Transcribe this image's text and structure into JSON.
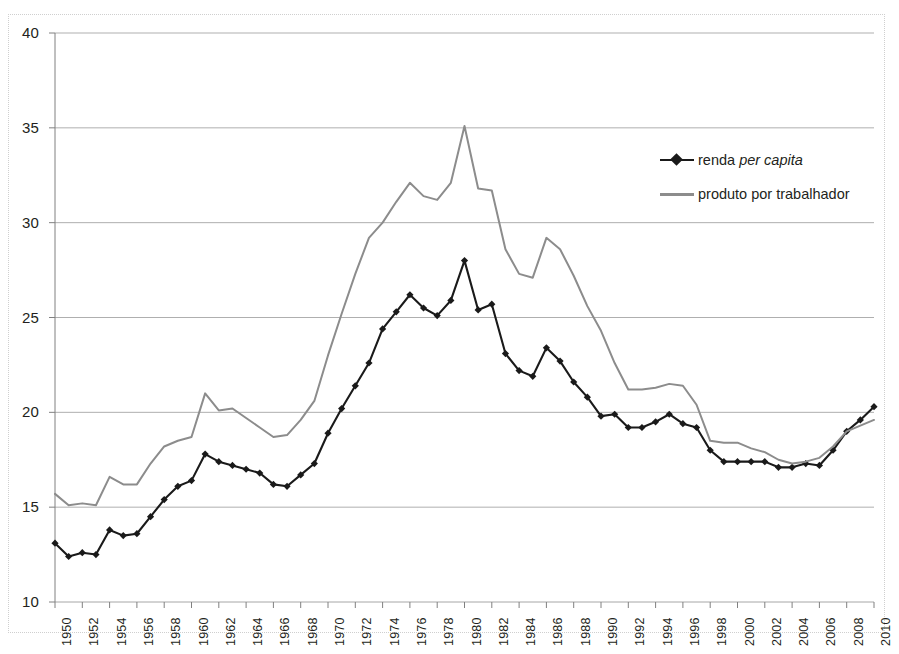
{
  "chart_data": {
    "type": "line",
    "title": "",
    "xlabel": "",
    "ylabel": "",
    "xlim": [
      1950,
      2010
    ],
    "ylim": [
      10,
      40
    ],
    "yticks": [
      10,
      15,
      20,
      25,
      30,
      35,
      40
    ],
    "xticks": [
      1950,
      1952,
      1954,
      1956,
      1958,
      1960,
      1962,
      1964,
      1966,
      1968,
      1970,
      1972,
      1974,
      1976,
      1978,
      1980,
      1982,
      1984,
      1986,
      1988,
      1990,
      1992,
      1994,
      1996,
      1998,
      2000,
      2002,
      2004,
      2006,
      2008,
      2010
    ],
    "grid": "horizontal",
    "legend_position": "upper-right",
    "x": [
      1950,
      1951,
      1952,
      1953,
      1954,
      1955,
      1956,
      1957,
      1958,
      1959,
      1960,
      1961,
      1962,
      1963,
      1964,
      1965,
      1966,
      1967,
      1968,
      1969,
      1970,
      1971,
      1972,
      1973,
      1974,
      1975,
      1976,
      1977,
      1978,
      1979,
      1980,
      1981,
      1982,
      1983,
      1984,
      1985,
      1986,
      1987,
      1988,
      1989,
      1990,
      1991,
      1992,
      1993,
      1994,
      1995,
      1996,
      1997,
      1998,
      1999,
      2000,
      2001,
      2002,
      2003,
      2004,
      2005,
      2006,
      2007,
      2008,
      2009,
      2010
    ],
    "series": [
      {
        "name": "renda per capita",
        "color": "#1a1a1a",
        "marker": "diamond",
        "values": [
          13.1,
          12.4,
          12.6,
          12.5,
          13.8,
          13.5,
          13.6,
          14.5,
          15.4,
          16.1,
          16.4,
          17.8,
          17.4,
          17.2,
          17.0,
          16.8,
          16.2,
          16.1,
          16.7,
          17.3,
          18.9,
          20.2,
          21.4,
          22.6,
          24.4,
          25.3,
          26.2,
          25.5,
          25.1,
          25.9,
          28.0,
          25.4,
          25.7,
          23.1,
          22.2,
          21.9,
          23.4,
          22.7,
          21.6,
          20.8,
          19.8,
          19.9,
          19.2,
          19.2,
          19.5,
          19.9,
          19.4,
          19.2,
          18.0,
          17.4,
          17.4,
          17.4,
          17.4,
          17.1,
          17.1,
          17.3,
          17.2,
          18.0,
          19.0,
          19.6,
          20.3
        ]
      },
      {
        "name": "produto por trabalhador",
        "color": "#8c8c8c",
        "marker": "none",
        "values": [
          15.7,
          15.1,
          15.2,
          15.1,
          16.6,
          16.2,
          16.2,
          17.3,
          18.2,
          18.5,
          18.7,
          21.0,
          20.1,
          20.2,
          19.7,
          19.2,
          18.7,
          18.8,
          19.6,
          20.6,
          23.0,
          25.2,
          27.3,
          29.2,
          30.0,
          31.1,
          32.1,
          31.4,
          31.2,
          32.1,
          35.1,
          31.8,
          31.7,
          28.6,
          27.3,
          27.1,
          29.2,
          28.6,
          27.2,
          25.6,
          24.3,
          22.6,
          21.2,
          21.2,
          21.3,
          21.5,
          21.4,
          20.4,
          18.5,
          18.4,
          18.4,
          18.1,
          17.9,
          17.5,
          17.3,
          17.4,
          17.6,
          18.2,
          19.0,
          19.3,
          19.6
        ]
      }
    ]
  },
  "legend": {
    "items": [
      {
        "label_plain": "renda ",
        "label_italic": "per capita",
        "style": "series-black"
      },
      {
        "label_plain": "produto por trabalhador",
        "label_italic": "",
        "style": "series-gray"
      }
    ]
  },
  "colors": {
    "series_black": "#1a1a1a",
    "series_gray": "#8c8c8c",
    "gridline": "#a6a6a6",
    "axis": "#808080",
    "text": "#231f20",
    "frame": "#cfcfcf",
    "background": "#ffffff"
  }
}
